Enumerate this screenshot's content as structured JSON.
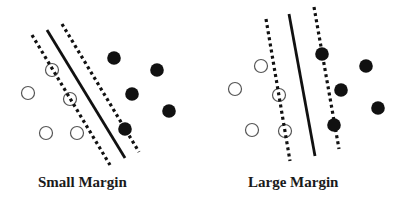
{
  "panels": [
    {
      "id": "small",
      "label": "Small Margin",
      "hyperplane": {
        "x1": 47,
        "y1": 30,
        "x2": 125,
        "y2": 158
      },
      "margin_lines": [
        {
          "x1": 32,
          "y1": 35,
          "x2": 110,
          "y2": 165
        },
        {
          "x1": 62,
          "y1": 24,
          "x2": 139,
          "y2": 152
        }
      ],
      "open_points": [
        {
          "x": 52,
          "y": 70,
          "support": true
        },
        {
          "x": 70,
          "y": 99,
          "support": true
        },
        {
          "x": 28,
          "y": 93,
          "support": false
        },
        {
          "x": 46,
          "y": 133,
          "support": false
        },
        {
          "x": 77,
          "y": 133,
          "support": false
        }
      ],
      "filled_points": [
        {
          "x": 114,
          "y": 58
        },
        {
          "x": 157,
          "y": 70
        },
        {
          "x": 132,
          "y": 94
        },
        {
          "x": 169,
          "y": 111
        },
        {
          "x": 125,
          "y": 129
        }
      ]
    },
    {
      "id": "large",
      "label": "Large Margin",
      "hyperplane": {
        "x1": 289,
        "y1": 14,
        "x2": 315,
        "y2": 156
      },
      "margin_lines": [
        {
          "x1": 266,
          "y1": 19,
          "x2": 290,
          "y2": 161
        },
        {
          "x1": 314,
          "y1": 7,
          "x2": 339,
          "y2": 149
        }
      ],
      "open_points": [
        {
          "x": 279,
          "y": 95,
          "support": true
        },
        {
          "x": 285,
          "y": 131,
          "support": true
        },
        {
          "x": 261,
          "y": 66,
          "support": false
        },
        {
          "x": 235,
          "y": 89,
          "support": false
        },
        {
          "x": 252,
          "y": 130,
          "support": false
        }
      ],
      "filled_points": [
        {
          "x": 322,
          "y": 54
        },
        {
          "x": 366,
          "y": 66
        },
        {
          "x": 341,
          "y": 90
        },
        {
          "x": 378,
          "y": 108
        },
        {
          "x": 334,
          "y": 125
        }
      ]
    }
  ],
  "style": {
    "ink": "#111111",
    "open_stroke": "#555555",
    "background": "#ffffff"
  }
}
